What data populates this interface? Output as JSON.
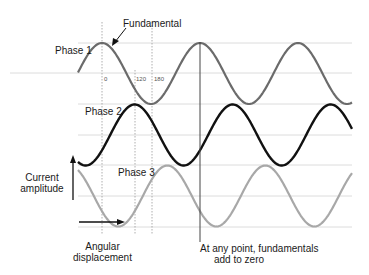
{
  "diagram": {
    "labels": {
      "fundamental": "Fundamental",
      "phase1": "Phase 1",
      "phase2": "Phase 2",
      "phase3": "Phase 3",
      "current_amplitude_line1": "Current",
      "current_amplitude_line2": "amplitude",
      "angular_line1": "Angular",
      "angular_line2": "displacement",
      "note_line1": "At any point, fundamentals",
      "note_line2": "add to zero"
    },
    "ticks": {
      "t0": "0",
      "t120": "120",
      "t180": "180"
    },
    "colors": {
      "phase1": "#6b6b6b",
      "phase2": "#111111",
      "phase3": "#a8a8a8",
      "grid": "#dcdcdc",
      "dotted": "#9a9a9a",
      "marker": "#444444"
    },
    "phases": [
      {
        "name": "Phase 1",
        "offset_deg": 0
      },
      {
        "name": "Phase 2",
        "offset_deg": 120
      },
      {
        "name": "Phase 3",
        "offset_deg": 240
      }
    ]
  }
}
